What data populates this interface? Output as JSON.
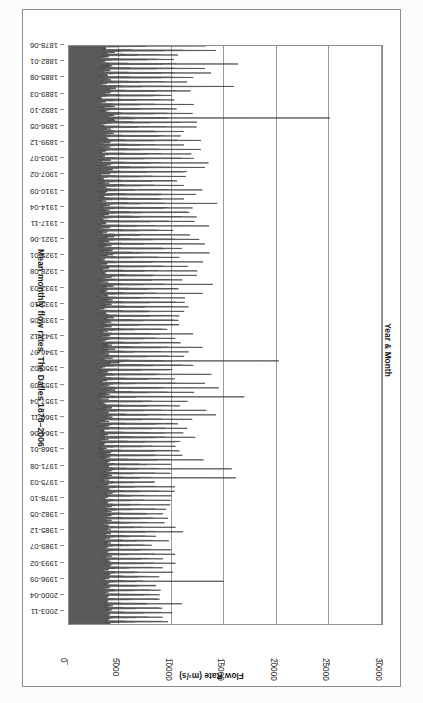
{
  "chart_data": {
    "type": "line",
    "title": "Mean monthly flow rates, The Dalles 1878–2006",
    "xlabel": "Year & Month",
    "ylabel": "Flow Rate (m³/s)",
    "orientation": "horizontal-bars-rotated",
    "grid": true,
    "legend": "none",
    "value_axis": {
      "label": "Flow Rate (m³/s)",
      "ticks": [
        30000,
        25000,
        20000,
        15000,
        10000,
        5000,
        0
      ],
      "tick_labels": [
        "30000",
        "25000",
        "20000",
        "15000",
        "10000",
        "5000",
        "0"
      ],
      "range": [
        0,
        30000
      ],
      "direction": "right-to-left"
    },
    "category_axis": {
      "label": "Year & Month",
      "tick_labels": [
        "1878-06",
        "1882-01",
        "1885-08",
        "1889-03",
        "1892-10",
        "1896-05",
        "1899-12",
        "1903-07",
        "1907-02",
        "1910-09",
        "1914-04",
        "1917-11",
        "1921-06",
        "1925-01",
        "1928-08",
        "1932-03",
        "1935-10",
        "1939-05",
        "1942-12",
        "1946-07",
        "1950-02",
        "1953-09",
        "1957-04",
        "1960-11",
        "1964-06",
        "1968-01",
        "1971-08",
        "1975-03",
        "1978-10",
        "1982-05",
        "1985-12",
        "1989-07",
        "1993-02",
        "1996-09",
        "2000-04",
        "2003-11"
      ],
      "start": "1878-06",
      "end": "2006-12",
      "n_points": 1543,
      "interval_months": 1,
      "tick_interval_months": 43
    },
    "notes": [
      "Monthly mean discharge of the Columbia River at The Dalles, Oregon.",
      "Strong annual cycle: spring/early-summer freshet peaks, late-summer/winter lows.",
      "Largest peak ≈ 25000 m³/s near 1894 (June 1894 flood).",
      "Second largest peak ≈ 20000 m³/s near 1948 (May/June 1948 flood).",
      "Post-1970 amplitudes are visibly damped by upstream regulation."
    ],
    "annual_cycle_mean_by_month": [
      2600,
      2500,
      2800,
      4200,
      7600,
      9600,
      6200,
      3400,
      2700,
      2700,
      3000,
      2900
    ],
    "peak_events": [
      {
        "label": "1894-06",
        "value": 25000
      },
      {
        "label": "1948-06",
        "value": 20100
      },
      {
        "label": "1876-06",
        "value": 17500
      },
      {
        "label": "1956-06",
        "value": 16800
      },
      {
        "label": "1974-06",
        "value": 16000
      },
      {
        "label": "1972-06",
        "value": 15600
      },
      {
        "label": "1997-06",
        "value": 14800
      },
      {
        "label": "1882-06",
        "value": 16200
      },
      {
        "label": "1887-06",
        "value": 15800
      },
      {
        "label": "1913-06",
        "value": 14200
      }
    ],
    "yearly_peaks": [
      14500,
      15900,
      13200,
      12600,
      16200,
      13800,
      14600,
      15100,
      12900,
      15800,
      13400,
      11800,
      12100,
      14900,
      13600,
      17000,
      25000,
      12400,
      13100,
      15200,
      14100,
      12700,
      13900,
      11600,
      14300,
      12200,
      13700,
      15400,
      12800,
      13050,
      11900,
      14700,
      12350,
      13550,
      14050,
      12150,
      15650,
      14250,
      12950,
      11450,
      13250,
      12050,
      14850,
      13450,
      12550,
      15050,
      13850,
      11250,
      12650,
      14450,
      13150,
      12450,
      11750,
      14950,
      13350,
      12250,
      15250,
      13950,
      11550,
      12750,
      14650,
      13050,
      12850,
      11350,
      13650,
      12950,
      14150,
      15450,
      12050,
      13750,
      20100,
      12150,
      11650,
      14350,
      13250,
      12350,
      16800,
      13550,
      11850,
      12250,
      14550,
      13150,
      15500,
      11950,
      13050,
      12650,
      15950,
      13450,
      12150,
      11450,
      14050,
      13650,
      12750,
      16000,
      12450,
      13950,
      11550,
      12250,
      14250,
      13350,
      11750,
      12050,
      13550,
      12850,
      14850,
      13150,
      11950,
      12350,
      14800,
      13250,
      12650,
      11250,
      13750,
      12450,
      14050,
      12950,
      11650,
      13350,
      12150,
      14250,
      13450,
      11850,
      12550,
      13050,
      14150
    ],
    "min_value": 1100,
    "max_value": 25000,
    "units": "m³/s",
    "series_color": "#3c3c3c"
  },
  "frame": {
    "border_color": "#8c8c8c",
    "background": "#ffffff"
  }
}
